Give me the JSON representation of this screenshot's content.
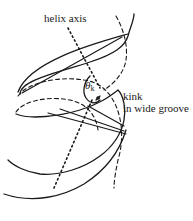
{
  "figure": {
    "labels": {
      "helix_axis": "helix axis",
      "theta": "θ",
      "theta_sub": "k",
      "kink_line1": "kink",
      "kink_line2": "in wide groove"
    },
    "colors": {
      "stroke": "#1a1a1a",
      "background": "#ffffff"
    }
  }
}
